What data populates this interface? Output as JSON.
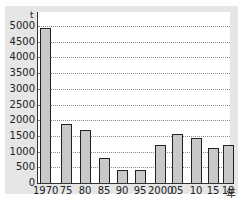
{
  "chart_data": {
    "type": "bar",
    "title": "",
    "xlabel": "年",
    "ylabel": "t",
    "categories": [
      "1970",
      "75",
      "80",
      "85",
      "90",
      "95",
      "2000",
      "05",
      "10",
      "15",
      "18"
    ],
    "values": [
      4950,
      1880,
      1700,
      800,
      400,
      400,
      1200,
      1550,
      1430,
      1100,
      1200
    ],
    "ylim": [
      0,
      5000
    ],
    "yticks": [
      "0",
      "500",
      "1000",
      "1500",
      "2000",
      "2500",
      "3000",
      "3500",
      "4000",
      "4500",
      "5000"
    ],
    "grid": true,
    "legend": null
  },
  "axis": {
    "y_unit": "t",
    "x_unit": "年"
  }
}
